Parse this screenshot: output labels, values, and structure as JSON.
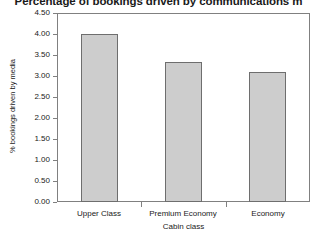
{
  "chart_data": {
    "type": "bar",
    "title": "Percentage of bookings driven by communications m",
    "xlabel": "Cabin class",
    "ylabel": "% bookings driven by media",
    "categories": [
      "Upper Class",
      "Premium Economy",
      "Economy"
    ],
    "values": [
      4.0,
      3.33,
      3.1
    ],
    "ylim": [
      0.0,
      4.5
    ],
    "ytick_labels": [
      "0.00",
      "0.50",
      "1.00",
      "1.50",
      "2.00",
      "2.50",
      "3.00",
      "3.50",
      "4.00",
      "4.50"
    ],
    "ytick_values": [
      0.0,
      0.5,
      1.0,
      1.5,
      2.0,
      2.5,
      3.0,
      3.5,
      4.0,
      4.5
    ],
    "grid": false,
    "legend": null,
    "bar_fill_color": "#cdcdcd",
    "bar_border_color": "#6e6e6e",
    "axis_color": "#808080",
    "text_color": "#1a1a1a",
    "background_color": "#ffffff"
  }
}
